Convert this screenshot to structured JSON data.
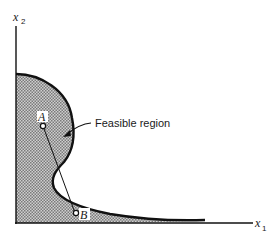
{
  "diagram": {
    "type": "nonconvex feasible region",
    "axes": {
      "x_label": "x",
      "x_sub": "1",
      "y_label": "x",
      "y_sub": "2"
    },
    "region_label": "Feasible region",
    "points": [
      {
        "name": "A",
        "x": 43,
        "y": 126
      },
      {
        "name": "B",
        "x": 75,
        "y": 213
      }
    ],
    "colors": {
      "boundary": "#111111",
      "fill_dark": "#7a7a7a",
      "fill_light": "#d4d4d4",
      "axis": "#111111"
    }
  }
}
